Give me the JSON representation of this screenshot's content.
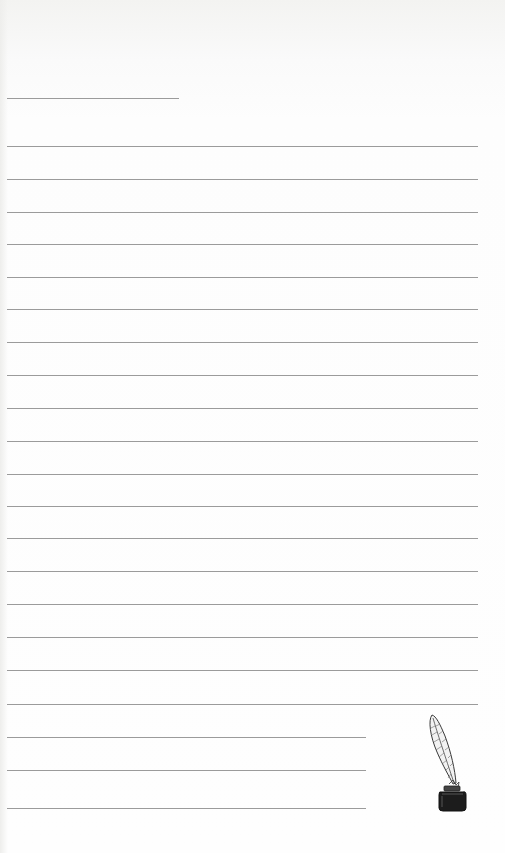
{
  "page": {
    "type": "lined-writing-paper",
    "background_color": "#fdfdfd",
    "rule_color": "#8a8a8a"
  },
  "header_rule": {
    "y": 98,
    "x1": 7,
    "x2": 179
  },
  "full_rules": {
    "x1": 7,
    "x2": 478,
    "ys": [
      146,
      179,
      212,
      244,
      277,
      309,
      342,
      375,
      408,
      441,
      474,
      506,
      538,
      571,
      604,
      637,
      670,
      704
    ]
  },
  "short_rules": {
    "x1": 7,
    "x2": 366,
    "ys": [
      737,
      770,
      808
    ]
  },
  "decoration": {
    "icon": "quill-inkwell-icon",
    "ink_color": "#1c1c1c"
  }
}
